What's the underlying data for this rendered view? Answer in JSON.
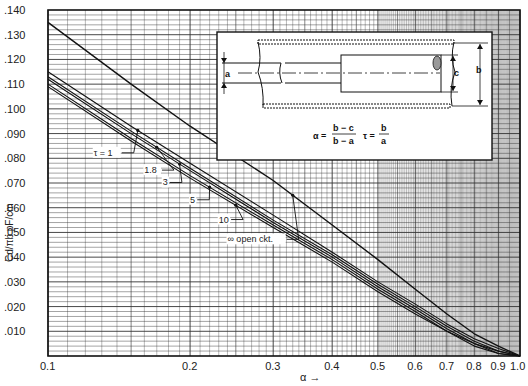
{
  "chart_data": {
    "type": "line",
    "title": "",
    "xlabel": "α →",
    "ylabel": "Cd/πb pF/cm",
    "x_scale": "log",
    "xlim": [
      0.1,
      1.0
    ],
    "ylim": [
      0.0,
      0.14
    ],
    "grid": true,
    "x_ticks": [
      "0.1",
      "0.2",
      "0.3",
      "0.4",
      "0.5",
      "0.6",
      "0.7",
      "0.8",
      "0.9",
      "1.0"
    ],
    "x_tick_values": [
      0.1,
      0.2,
      0.3,
      0.4,
      0.5,
      0.6,
      0.7,
      0.8,
      0.9,
      1.0
    ],
    "y_ticks": [
      ".010",
      ".020",
      ".030",
      ".040",
      ".050",
      ".060",
      ".070",
      ".080",
      ".090",
      ".100",
      ".110",
      ".120",
      ".130",
      ".140"
    ],
    "y_tick_values": [
      0.01,
      0.02,
      0.03,
      0.04,
      0.05,
      0.06,
      0.07,
      0.08,
      0.09,
      0.1,
      0.11,
      0.12,
      0.13,
      0.14
    ],
    "x": [
      0.1,
      0.15,
      0.2,
      0.3,
      0.4,
      0.5,
      0.6,
      0.7,
      0.8,
      0.9,
      1.0
    ],
    "series": [
      {
        "name": "τ = ∞ open ckt.",
        "values": [
          0.135,
          0.11,
          0.093,
          0.071,
          0.053,
          0.039,
          0.027,
          0.017,
          0.009,
          0.004,
          0.0
        ]
      },
      {
        "name": "τ = 1",
        "values": [
          0.115,
          0.093,
          0.078,
          0.057,
          0.042,
          0.03,
          0.021,
          0.013,
          0.007,
          0.003,
          0.0
        ]
      },
      {
        "name": "τ = 1.8",
        "values": [
          0.113,
          0.091,
          0.076,
          0.055,
          0.041,
          0.029,
          0.02,
          0.012,
          0.006,
          0.002,
          0.0
        ]
      },
      {
        "name": "τ = 3",
        "values": [
          0.112,
          0.09,
          0.075,
          0.054,
          0.04,
          0.028,
          0.019,
          0.011,
          0.005,
          0.002,
          0.0
        ]
      },
      {
        "name": "τ = 5",
        "values": [
          0.11,
          0.088,
          0.073,
          0.053,
          0.039,
          0.027,
          0.018,
          0.01,
          0.005,
          0.001,
          0.0
        ]
      },
      {
        "name": "τ = 10",
        "values": [
          0.109,
          0.087,
          0.072,
          0.052,
          0.038,
          0.026,
          0.017,
          0.01,
          0.004,
          0.001,
          0.0
        ]
      }
    ],
    "annotations": [
      {
        "text": "τ = 1",
        "x": 0.125,
        "y": 0.081,
        "points_to_series": 1
      },
      {
        "text": "1.8",
        "x": 0.16,
        "y": 0.074,
        "points_to_series": 2
      },
      {
        "text": "3",
        "x": 0.175,
        "y": 0.069,
        "points_to_series": 3
      },
      {
        "text": "5",
        "x": 0.2,
        "y": 0.062,
        "points_to_series": 4
      },
      {
        "text": "10",
        "x": 0.23,
        "y": 0.054,
        "points_to_series": 5
      },
      {
        "text": "∞ open ckt.",
        "x": 0.24,
        "y": 0.046,
        "points_to_series": 0
      }
    ]
  },
  "inset": {
    "labels": {
      "a": "a",
      "b": "b",
      "c": "c"
    },
    "formula_alpha": "α = (b − c)/(b − a)",
    "formula_alpha_lhs": "α =",
    "formula_alpha_num": "b − c",
    "formula_alpha_den": "b − a",
    "formula_tau_lhs": "τ =",
    "formula_tau_num": "b",
    "formula_tau_den": "a"
  },
  "colors": {
    "ink": "#1a1a1a",
    "grid": "#555555",
    "paper": "#ffffff"
  }
}
